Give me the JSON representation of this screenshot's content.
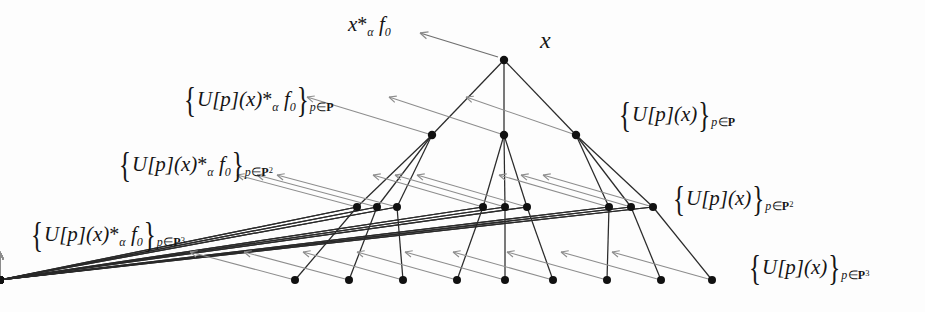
{
  "figure": {
    "type": "tree-diagram",
    "title_visible": false,
    "background": "#fdfdfd",
    "node_color": "#111111",
    "edge_color": "#2a2a2a",
    "arrow_color": "#8d8d8d"
  },
  "labels": {
    "root": "x",
    "root_output": {
      "full": "x *α f0",
      "lead": "x",
      "star": "*",
      "alpha": "α",
      "f": "f",
      "f_sub": "0"
    },
    "left": [
      {
        "id": "level1-left",
        "full": "{U[p](x) *α f0}p∈P",
        "open": "{",
        "body": "U[p](x)",
        "star": "*",
        "alpha": "α",
        "f": "f",
        "f_sub": "0",
        "close": "}",
        "sub_p": "p",
        "sub_in": "∈",
        "sub_set": "P",
        "sub_exp": ""
      },
      {
        "id": "level2-left",
        "full": "{U[p](x) *α f0}p∈P2",
        "open": "{",
        "body": "U[p](x)",
        "star": "*",
        "alpha": "α",
        "f": "f",
        "f_sub": "0",
        "close": "}",
        "sub_p": "p",
        "sub_in": "∈",
        "sub_set": "P",
        "sub_exp": "2"
      },
      {
        "id": "level3-left",
        "full": "{U[p](x) *α f0}p∈P3",
        "open": "{",
        "body": "U[p](x)",
        "star": "*",
        "alpha": "α",
        "f": "f",
        "f_sub": "0",
        "close": "}",
        "sub_p": "p",
        "sub_in": "∈",
        "sub_set": "P",
        "sub_exp": "3"
      }
    ],
    "right": [
      {
        "id": "level1-right",
        "full": "{U[p](x)}p∈P",
        "open": "{",
        "body": "U[p](x)",
        "close": "}",
        "sub_p": "p",
        "sub_in": "∈",
        "sub_set": "P",
        "sub_exp": ""
      },
      {
        "id": "level2-right",
        "full": "{U[p](x)}p∈P2",
        "open": "{",
        "body": "U[p](x)",
        "close": "}",
        "sub_p": "p",
        "sub_in": "∈",
        "sub_set": "P",
        "sub_exp": "2"
      },
      {
        "id": "level3-right",
        "full": "{U[p](x)}p∈P3",
        "open": "{",
        "body": "U[p](x)",
        "close": "}",
        "sub_p": "p",
        "sub_in": "∈",
        "sub_set": "P",
        "sub_exp": "3"
      }
    ]
  },
  "chart_data": {
    "type": "tree",
    "branching_factor": 3,
    "depth": 3,
    "levels": [
      {
        "level": 0,
        "count": 1,
        "y": 60,
        "label": "x"
      },
      {
        "level": 1,
        "count": 3,
        "y": 135,
        "label": "{U[p](x)}p∈P"
      },
      {
        "level": 2,
        "count": 9,
        "y": 207,
        "label": "{U[p](x)}p∈P2"
      },
      {
        "level": 3,
        "count": 27,
        "y": 280,
        "label": "{U[p](x)}p∈P3"
      }
    ],
    "nodes": {
      "root": [
        {
          "x": 504,
          "y": 60
        }
      ],
      "level1": [
        {
          "x": 432,
          "y": 135
        },
        {
          "x": 504,
          "y": 135
        },
        {
          "x": 576,
          "y": 135
        }
      ],
      "level2": [
        {
          "x": 357,
          "y": 207
        },
        {
          "x": 377,
          "y": 207
        },
        {
          "x": 397,
          "y": 207
        },
        {
          "x": 483,
          "y": 207
        },
        {
          "x": 505,
          "y": 207
        },
        {
          "x": 527,
          "y": 207
        },
        {
          "x": 609,
          "y": 207
        },
        {
          "x": 631,
          "y": 207
        },
        {
          "x": 653,
          "y": 207
        }
      ],
      "level3_group_centers": [
        295,
        349,
        403,
        457,
        505,
        553,
        607,
        661,
        712
      ],
      "level3_spacing": 17,
      "level3_count": 27
    }
  }
}
